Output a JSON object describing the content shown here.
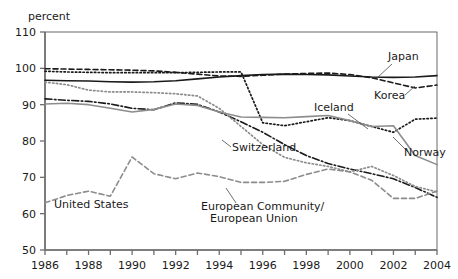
{
  "chart_data": {
    "type": "line",
    "title": "",
    "subtitle": "",
    "xlabel": "",
    "ylabel": "percent",
    "unit_label": "percent",
    "xlim": [
      1986,
      2004
    ],
    "ylim": [
      50,
      110
    ],
    "yticks": [
      50,
      60,
      70,
      80,
      90,
      100,
      110
    ],
    "ytick_labels": [
      "50",
      "60",
      "70",
      "80",
      "90",
      "100",
      "110"
    ],
    "xticks": [
      1986,
      1987,
      1988,
      1989,
      1990,
      1991,
      1992,
      1993,
      1994,
      1995,
      1996,
      1997,
      1998,
      1999,
      2000,
      2001,
      2002,
      2003,
      2004
    ],
    "xtick_labels_shown": [
      "1986",
      "1988",
      "1990",
      "1992",
      "1994",
      "1996",
      "1998",
      "2000",
      "2002",
      "2004"
    ],
    "grid": false,
    "legend": "inline-annotations",
    "x": [
      1986,
      1987,
      1988,
      1989,
      1990,
      1991,
      1992,
      1993,
      1994,
      1995,
      1996,
      1997,
      1998,
      1999,
      2000,
      2001,
      2002,
      2003,
      2004
    ],
    "series": [
      {
        "name": "Japan",
        "style": "solid",
        "color": "#1a1a1a",
        "width": 1.6,
        "values": [
          96.7,
          96.6,
          96.5,
          96.3,
          96.2,
          96.3,
          96.6,
          97.1,
          97.6,
          98.0,
          98.3,
          98.4,
          98.3,
          98.2,
          97.9,
          97.6,
          97.5,
          97.6,
          98.0
        ]
      },
      {
        "name": "Korea",
        "style": "dashed",
        "color": "#1a1a1a",
        "width": 1.6,
        "values": [
          99.9,
          99.8,
          99.7,
          99.6,
          99.5,
          99.3,
          98.9,
          98.4,
          97.9,
          97.8,
          98.1,
          98.4,
          98.6,
          98.7,
          98.3,
          97.4,
          96.0,
          94.6,
          95.4
        ]
      },
      {
        "name": "Iceland",
        "style": "dotted",
        "color": "#1a1a1a",
        "width": 1.7,
        "values": [
          99.2,
          99.0,
          98.9,
          98.8,
          98.8,
          98.8,
          98.8,
          98.9,
          99.0,
          99.0,
          85.0,
          84.2,
          85.3,
          86.4,
          85.6,
          84.0,
          82.4,
          86.0,
          86.3
        ]
      },
      {
        "name": "Switzerland",
        "style": "dashdot",
        "color": "#1a1a1a",
        "width": 1.6,
        "values": [
          91.6,
          91.2,
          90.9,
          90.2,
          89.0,
          88.6,
          90.5,
          90.1,
          88.0,
          85.3,
          82.4,
          79.0,
          76.0,
          73.8,
          72.3,
          71.0,
          69.6,
          67.2,
          64.5
        ]
      },
      {
        "name": "Norway",
        "style": "solid",
        "color": "#8c8c8c",
        "width": 1.6,
        "values": [
          90.2,
          90.4,
          90.0,
          89.0,
          88.0,
          88.7,
          90.2,
          89.8,
          88.0,
          86.6,
          86.5,
          86.4,
          86.7,
          87.0,
          85.6,
          84.0,
          84.2,
          76.0,
          73.5
        ]
      },
      {
        "name": "European Community/European Union",
        "style": "dotted",
        "color": "#8c8c8c",
        "width": 1.7,
        "values": [
          96.2,
          95.5,
          94.0,
          93.5,
          93.5,
          93.3,
          93.0,
          92.4,
          89.0,
          84.0,
          79.0,
          75.5,
          74.0,
          73.0,
          71.5,
          73.0,
          70.5,
          67.5,
          66.0
        ]
      },
      {
        "name": "United States",
        "style": "dashed",
        "color": "#8c8c8c",
        "width": 1.6,
        "values": [
          63.0,
          65.0,
          66.2,
          64.8,
          75.6,
          71.0,
          69.6,
          71.2,
          70.2,
          68.6,
          68.6,
          68.9,
          70.8,
          72.3,
          71.5,
          69.2,
          64.2,
          64.2,
          66.2
        ]
      }
    ],
    "annotations": [
      {
        "name": "japan-label",
        "text": "Japan",
        "x": 388,
        "y": 60,
        "anchor": "start"
      },
      {
        "name": "korea-label",
        "text": "Korea",
        "x": 374,
        "y": 99,
        "anchor": "start"
      },
      {
        "name": "iceland-label",
        "text": "Iceland",
        "x": 314,
        "y": 111,
        "anchor": "start"
      },
      {
        "name": "norway-label",
        "text": "Norway",
        "x": 404,
        "y": 156,
        "anchor": "start"
      },
      {
        "name": "switzerland-label",
        "text": "Switzerland",
        "x": 232,
        "y": 151,
        "anchor": "start"
      },
      {
        "name": "united-states-label",
        "text": "United States",
        "x": 54,
        "y": 208,
        "anchor": "start"
      },
      {
        "name": "ec-eu-label-line1",
        "text": "European Community/",
        "x": 201,
        "y": 210,
        "anchor": "start"
      },
      {
        "name": "ec-eu-label-line2",
        "text": "European Union",
        "x": 210,
        "y": 222,
        "anchor": "start"
      }
    ]
  }
}
